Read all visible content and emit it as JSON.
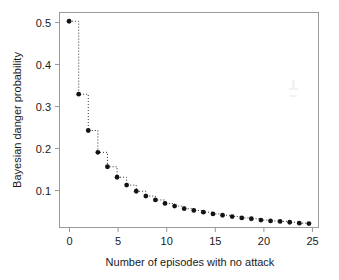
{
  "chart_data": {
    "type": "line",
    "title": "",
    "subtitle": "",
    "xlabel": "Number of episodes with no attack",
    "ylabel": "Bayesian danger probability",
    "xlim": [
      -1,
      26
    ],
    "ylim": [
      0.028,
      0.52
    ],
    "xticks": [
      0,
      5,
      10,
      15,
      20,
      25
    ],
    "xticklabels": [
      "0",
      "5",
      "10",
      "15",
      "20",
      "25"
    ],
    "yticks": [
      0.1,
      0.2,
      0.3,
      0.4,
      0.5
    ],
    "yticklabels": [
      "0.1",
      "0.2",
      "0.3",
      "0.4",
      "0.5"
    ],
    "grid": false,
    "legend": null,
    "legend_position": "none",
    "marker": "filled-circle",
    "linestyle": "dotted-step",
    "x": [
      0,
      1,
      2,
      3,
      4,
      5,
      6,
      7,
      8,
      9,
      10,
      11,
      12,
      13,
      14,
      15,
      16,
      17,
      18,
      19,
      20,
      21,
      22,
      23,
      24,
      25
    ],
    "values": [
      0.5,
      0.333,
      0.25,
      0.2,
      0.167,
      0.143,
      0.125,
      0.111,
      0.1,
      0.091,
      0.083,
      0.077,
      0.071,
      0.067,
      0.063,
      0.059,
      0.056,
      0.053,
      0.05,
      0.048,
      0.045,
      0.043,
      0.042,
      0.04,
      0.038,
      0.037
    ],
    "series": [
      {
        "name": "Bayesian danger probability",
        "values": [
          0.5,
          0.333,
          0.25,
          0.2,
          0.167,
          0.143,
          0.125,
          0.111,
          0.1,
          0.091,
          0.083,
          0.077,
          0.071,
          0.067,
          0.063,
          0.059,
          0.056,
          0.053,
          0.05,
          0.048,
          0.045,
          0.043,
          0.042,
          0.04,
          0.038,
          0.037
        ]
      }
    ],
    "colors": {
      "marker": "#141414",
      "line": "#2b2b2b",
      "frame": "#9a9a9a",
      "text": "#1a1a1a",
      "background": "#ffffff"
    }
  }
}
